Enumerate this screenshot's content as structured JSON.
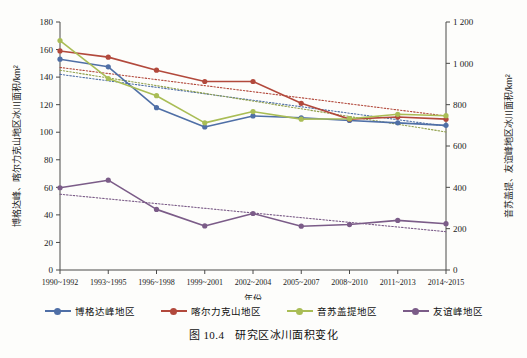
{
  "figure": {
    "caption_number": "图 10.4",
    "caption_text": "研究区冰川面积变化"
  },
  "chart_data": {
    "type": "line",
    "title": "研究区冰川面积变化",
    "xlabel": "年份",
    "ylabel": "博格达峰、喀尔力克山地区冰川面积/km²",
    "ylabel_right": "音苏盖提、友谊峰地区冰川面积/km²",
    "grid": false,
    "legend_position": "bottom",
    "categories": [
      "1990~1992",
      "1993~1995",
      "1996~1998",
      "1999~2001",
      "2002~2004",
      "2005~2007",
      "2008~2010",
      "2011~2013",
      "2014~2015"
    ],
    "ylim": [
      0,
      180
    ],
    "yticks": [
      0,
      20,
      40,
      60,
      80,
      100,
      120,
      140,
      160,
      180
    ],
    "ylim_right": [
      0,
      1200
    ],
    "yticks_right": [
      "0",
      "200",
      "400",
      "600",
      "800",
      "1 000",
      "1 200"
    ],
    "ytick_values_right": [
      0,
      200,
      400,
      600,
      800,
      1000,
      1200
    ],
    "series": [
      {
        "name": "博格达峰地区",
        "color": "#4f6fa6",
        "axis": "left",
        "values": [
          153.0,
          147.5,
          117.8,
          103.8,
          111.8,
          110.5,
          108.5,
          106.8,
          105.0
        ],
        "trend": [
          142.0,
          137.3,
          132.6,
          127.9,
          123.2,
          118.5,
          113.8,
          109.1,
          104.4
        ],
        "trend_color": "#4f6fa6"
      },
      {
        "name": "喀尔力克山地区",
        "color": "#b2493c",
        "axis": "left",
        "values": [
          159.0,
          154.5,
          145.0,
          136.8,
          136.8,
          121.0,
          109.5,
          111.0,
          109.5
        ],
        "trend": [
          147.0,
          142.6,
          138.2,
          133.8,
          129.4,
          125.0,
          120.6,
          116.2,
          111.8
        ],
        "trend_color": "#b2493c"
      },
      {
        "name": "音苏盖提地区",
        "color": "#a9bd55",
        "axis": "left",
        "values": [
          166.5,
          139.0,
          126.5,
          106.8,
          115.0,
          109.5,
          109.8,
          113.0,
          112.0
        ],
        "trend": [
          145.0,
          139.4,
          133.8,
          128.2,
          122.6,
          117.0,
          111.4,
          105.8,
          100.2
        ],
        "trend_color": "#8f9f4a"
      },
      {
        "name": "友谊峰地区",
        "color": "#7b5c88",
        "axis": "right",
        "values_right": [
          398.0,
          435.0,
          293.0,
          213.0,
          273.0,
          212.0,
          220.0,
          240.0,
          224.0
        ],
        "values": [
          59.7,
          65.2,
          44.0,
          32.0,
          41.0,
          31.8,
          33.0,
          36.0,
          33.6
        ],
        "trend": [
          55.0,
          51.6,
          48.2,
          44.8,
          41.4,
          38.0,
          34.6,
          31.2,
          27.8
        ],
        "trend_color": "#7b5c88"
      }
    ]
  },
  "legend": {
    "items": [
      {
        "label": "博格达峰地区",
        "color": "#4f6fa6"
      },
      {
        "label": "喀尔力克山地区",
        "color": "#b2493c"
      },
      {
        "label": "音苏盖提地区",
        "color": "#a9bd55"
      },
      {
        "label": "友谊峰地区",
        "color": "#7b5c88"
      }
    ]
  }
}
